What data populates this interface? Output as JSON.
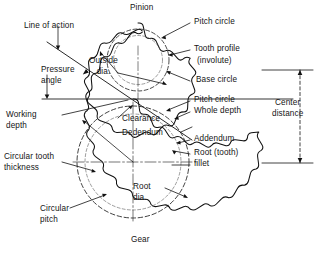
{
  "diagram": {
    "title_top": "Pinion",
    "title_bottom": "Gear",
    "ink_color": "#111111",
    "background": "#ffffff"
  },
  "labels": {
    "pinion": "Pinion",
    "gear": "Gear",
    "line_of_action": "Line of action",
    "pressure_angle": "Pressure\nangle",
    "working_depth": "Working\ndepth",
    "circular_tooth_thickness": "Circular tooth\nthickness",
    "circular_pitch": "Circular\npitch",
    "outside_dia": "Outside\ndia.",
    "clearance": "Clearance",
    "dedendum": "Dedendum",
    "root_dia": "Root\ndia.",
    "pitch_circle_top": "Pitch circle",
    "tooth_profile": "Tooth profile",
    "tooth_profile_sub": "(involute)",
    "base_circle": "Base circle",
    "pitch_circle_lower": "Pitch circle",
    "whole_depth": "Whole depth",
    "addendum": "Addendum",
    "root_tooth": "Root (tooth)",
    "fillet": "fillet",
    "center_distance": "Center\ndistance"
  },
  "geometry": {
    "pinion": {
      "cx": 138,
      "cy": 60,
      "outer_r": 37,
      "pitch_r": 31,
      "root_r": 25,
      "teeth": 16
    },
    "gear": {
      "cx": 133,
      "cy": 162,
      "outer_r": 63,
      "pitch_r": 56,
      "root_r": 48,
      "teeth": 26
    },
    "pitch_point": {
      "x": 135,
      "y": 99
    },
    "center_distance_line": {
      "x": 300,
      "y_top": 70,
      "y_bottom": 163
    },
    "line_of_action": {
      "x1": 47,
      "y1": 42,
      "x2": 190,
      "y2": 139
    }
  }
}
